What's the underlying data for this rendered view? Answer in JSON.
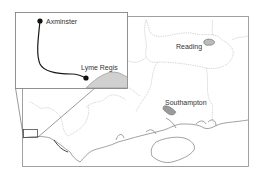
{
  "map": {
    "places": [
      {
        "name": "Reading"
      },
      {
        "name": "Southampton"
      }
    ]
  },
  "inset": {
    "places": [
      {
        "name": "Axminster"
      },
      {
        "name": "Lyme Regis"
      }
    ],
    "route_color": "#1a1a1a",
    "coast_fill": "#d0d0d0"
  },
  "colors": {
    "frame": "#8a8a8a",
    "boundary": "#b5b5b5",
    "coast": "#7a7a7a",
    "urban": "#9a9a9a"
  }
}
